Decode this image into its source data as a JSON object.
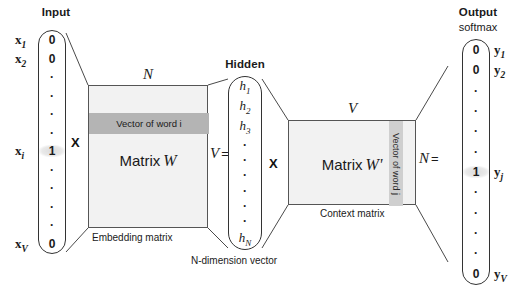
{
  "diagram": {
    "title_input": "Input",
    "title_hidden": "Hidden",
    "title_output": "Output",
    "subtitle_output": "softmax",
    "operator_multiply_1": "X",
    "operator_multiply_2": "X",
    "dim_w_top": "N",
    "dim_w_right": "V",
    "dim_w_right_equals": "=",
    "dim_wp_top": "V",
    "dim_wp_right": "N",
    "dim_wp_right_equals": "=",
    "caption_embedding": "Embedding matrix",
    "caption_ndim": "N-dimension vector",
    "caption_context": "Context matrix",
    "matrix_w_label": "Matrix",
    "matrix_w_name": "W",
    "matrix_wp_label": "Matrix",
    "matrix_wp_name": "W'",
    "band_word_i": "Vector of word i",
    "band_word_j": "Vector of word j"
  },
  "input_vector": {
    "cells": [
      "0",
      "0",
      "·",
      "·",
      "·",
      "·",
      "1",
      "·",
      "·",
      "·",
      "·",
      "0"
    ],
    "highlight_index": 6,
    "labels": [
      {
        "base": "x",
        "sub": "1",
        "cell_index": 0
      },
      {
        "base": "x",
        "sub": "2",
        "cell_index": 1
      },
      {
        "base": "x",
        "sub": "i",
        "cell_index": 6
      },
      {
        "base": "x",
        "sub": "V",
        "cell_index": 11
      }
    ]
  },
  "hidden_vector": {
    "cells": [
      "h1",
      "h2",
      "h3",
      "·",
      "·",
      "·",
      "·",
      "·",
      "·",
      "hN"
    ],
    "named": [
      {
        "base": "h",
        "sub": "1"
      },
      {
        "base": "h",
        "sub": "2"
      },
      {
        "base": "h",
        "sub": "3"
      },
      {
        "base": "h",
        "sub": "N"
      }
    ]
  },
  "output_vector": {
    "cells": [
      "0",
      "0",
      "·",
      "·",
      "·",
      "·",
      "1",
      "·",
      "·",
      "·",
      "·",
      "0"
    ],
    "highlight_index": 6,
    "labels": [
      {
        "base": "y",
        "sub": "1",
        "cell_index": 0
      },
      {
        "base": "y",
        "sub": "2",
        "cell_index": 1
      },
      {
        "base": "y",
        "sub": "j",
        "cell_index": 6
      },
      {
        "base": "y",
        "sub": "V",
        "cell_index": 11
      }
    ]
  },
  "colors": {
    "matrix_fill": "#f2f2f2",
    "band_h_fill": "#b4b4b4",
    "band_v_fill": "#cfcfcf",
    "stroke": "#333333",
    "text": "#1a1a1a"
  }
}
